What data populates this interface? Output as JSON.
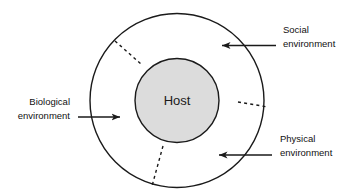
{
  "diagram": {
    "type": "concentric-circle-ecological-model",
    "title_visible": false,
    "center": {
      "label": "Host"
    },
    "outer_ring": {
      "label": ""
    },
    "annotations": [
      {
        "id": "social",
        "line1": "Social",
        "line2": "environment",
        "arrow_direction": "left",
        "position": "top-right"
      },
      {
        "id": "biological",
        "line1": "Biological",
        "line2": "environment",
        "arrow_direction": "right",
        "position": "left"
      },
      {
        "id": "physical",
        "line1": "Physical",
        "line2": "environment",
        "arrow_direction": "left",
        "position": "bottom-right"
      }
    ],
    "dashed_separators": 3,
    "colors": {
      "stroke": "#1a1a1a",
      "inner_fill": "#dcdcdc",
      "outer_fill": "#ffffff",
      "text": "#111111",
      "background": "#ffffff"
    }
  }
}
